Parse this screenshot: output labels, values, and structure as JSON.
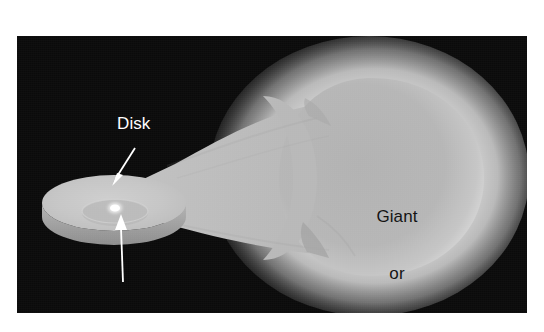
{
  "figure": {
    "domain": "diagram",
    "background_color": "#ffffff",
    "panel": {
      "background_color": "#0a0a0a",
      "x": 17,
      "y": 36,
      "width": 510,
      "height": 277
    }
  },
  "labels": {
    "disk": {
      "text": "Disk",
      "color": "#ffffff",
      "points_to": "accretion-disk"
    },
    "white_dwarf": {
      "line1": "White",
      "line2": "dwarf",
      "color": "#ffffff",
      "points_to": "white-dwarf-star"
    },
    "giant": {
      "line1": "Giant",
      "line2": "or",
      "line3": "supergiant",
      "color": "#141414",
      "placed_on": "giant-star-body"
    }
  },
  "objects": {
    "giant_star": {
      "name": "Giant or supergiant",
      "shape": "teardrop Roche lobe",
      "body_color": "#b5b5b5",
      "halo_color": "#d8d8d8",
      "glow": true
    },
    "accretion_disk": {
      "name": "Disk",
      "shape": "ellipse with raised rim",
      "top_color": "#c9c9c9",
      "rim_color": "#9a9a9a",
      "inner_ring_color": "#bdbdbd"
    },
    "white_dwarf": {
      "name": "White dwarf",
      "shape": "small bright point",
      "color": "#ffffff"
    },
    "accretion_stream": {
      "name": "mass transfer stream",
      "color": "#b8b8b8",
      "from": "giant_star",
      "to": "accretion_disk"
    }
  }
}
